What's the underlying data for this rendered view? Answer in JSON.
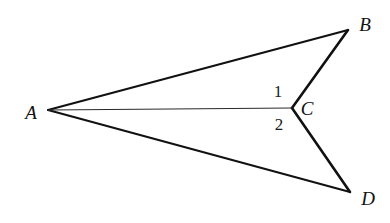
{
  "figure": {
    "background_color": "#ffffff",
    "stroke_color": "#111111",
    "diagonal_color": "#2a2a2a",
    "width": 390,
    "height": 223,
    "points": {
      "A": {
        "x": 48,
        "y": 110
      },
      "B": {
        "x": 348,
        "y": 30
      },
      "C": {
        "x": 292,
        "y": 108
      },
      "D": {
        "x": 350,
        "y": 192
      }
    },
    "segments": [
      {
        "name": "AB",
        "from": "A",
        "to": "B",
        "width": 2.0,
        "style": "solid"
      },
      {
        "name": "BC",
        "from": "B",
        "to": "C",
        "width": 2.6,
        "style": "solid"
      },
      {
        "name": "CD",
        "from": "C",
        "to": "D",
        "width": 2.6,
        "style": "solid"
      },
      {
        "name": "AD",
        "from": "A",
        "to": "D",
        "width": 2.0,
        "style": "solid"
      },
      {
        "name": "AC",
        "from": "A",
        "to": "C",
        "width": 1.2,
        "style": "solid"
      }
    ],
    "vertex_labels": [
      {
        "id": "A",
        "text": "A",
        "x": 31,
        "y": 112
      },
      {
        "id": "B",
        "text": "B",
        "x": 365,
        "y": 24
      },
      {
        "id": "C",
        "text": "C",
        "x": 307,
        "y": 108
      },
      {
        "id": "D",
        "text": "D",
        "x": 368,
        "y": 198
      }
    ],
    "angle_labels": [
      {
        "id": "1",
        "text": "1",
        "x": 278,
        "y": 91
      },
      {
        "id": "2",
        "text": "2",
        "x": 279,
        "y": 124
      }
    ]
  }
}
